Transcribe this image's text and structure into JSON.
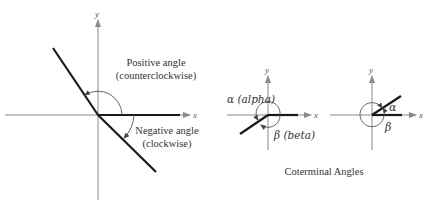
{
  "figure": {
    "left_diagram": {
      "x_axis_label": "x",
      "y_axis_label": "y",
      "positive_label_line1": "Positive angle",
      "positive_label_line2": "(counterclockwise)",
      "negative_label_line1": "Negative angle",
      "negative_label_line2": "(clockwise)"
    },
    "middle_diagram": {
      "x_axis_label": "x",
      "y_axis_label": "y",
      "alpha_label": "α (alpha)",
      "beta_label": "β (beta)"
    },
    "right_diagram": {
      "x_axis_label": "x",
      "y_axis_label": "y",
      "alpha_label": "α",
      "beta_label": "β"
    },
    "caption": "Coterminal Angles"
  },
  "colors": {
    "axis": "#8a8a8a",
    "ray": "#1a1a1a",
    "text": "#333333"
  }
}
